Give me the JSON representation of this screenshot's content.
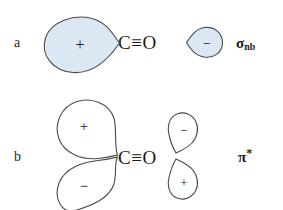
{
  "figure": {
    "background_color": "#ffffff",
    "lobe_fill_color": "#dbe7f3",
    "lobe_stroke_color": "#4a4a4a",
    "text_color": "#1a1a1a"
  },
  "rows": [
    {
      "id": "a",
      "label": "a",
      "molecule": "C≡O",
      "orbital_label": "σ",
      "orbital_subscript": "nb",
      "orbital_superscript": "",
      "orbital_full": "σnb",
      "lobes": [
        {
          "id": "a-left-large",
          "sign": "+",
          "filled": true,
          "position": "left-of-carbon",
          "size": "large",
          "points": "right"
        },
        {
          "id": "a-right-small",
          "sign": "−",
          "filled": true,
          "position": "right-of-oxygen",
          "size": "small",
          "points": "left"
        }
      ]
    },
    {
      "id": "b",
      "label": "b",
      "molecule": "C≡O",
      "orbital_label": "π",
      "orbital_subscript": "",
      "orbital_superscript": "*",
      "orbital_full": "π*",
      "lobes": [
        {
          "id": "b-left-upper",
          "sign": "+",
          "filled": false,
          "position": "above-left-of-carbon",
          "size": "large",
          "points": "lower-right"
        },
        {
          "id": "b-left-lower",
          "sign": "−",
          "filled": false,
          "position": "below-left-of-carbon",
          "size": "large",
          "points": "upper-right"
        },
        {
          "id": "b-right-upper",
          "sign": "−",
          "filled": false,
          "position": "above-right-of-oxygen",
          "size": "small",
          "points": "lower-left"
        },
        {
          "id": "b-right-lower",
          "sign": "+",
          "filled": false,
          "position": "below-right-of-oxygen",
          "size": "small",
          "points": "upper-left"
        }
      ]
    }
  ]
}
